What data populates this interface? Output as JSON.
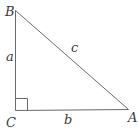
{
  "diagram": {
    "type": "right-triangle",
    "vertices": [
      {
        "id": "B",
        "label": "B",
        "x": 15,
        "y": 10,
        "label_x": 5,
        "label_y": 16
      },
      {
        "id": "C",
        "label": "C",
        "x": 15,
        "y": 110,
        "label_x": 6,
        "label_y": 127,
        "right_angle": true
      },
      {
        "id": "A",
        "label": "A",
        "x": 128,
        "y": 109,
        "label_x": 130,
        "label_y": 122
      }
    ],
    "sides": [
      {
        "id": "a",
        "label": "a",
        "from": "B",
        "to": "C",
        "label_x": 6,
        "label_y": 61
      },
      {
        "id": "b",
        "label": "b",
        "from": "C",
        "to": "A",
        "label_x": 64,
        "label_y": 124
      },
      {
        "id": "c",
        "label": "c",
        "from": "B",
        "to": "A",
        "label_x": 70,
        "label_y": 52
      }
    ],
    "right_angle_marker_size": 12,
    "colors": {
      "stroke": "#6a6a6a",
      "text": "#3a3a3a",
      "background": "#ffffff"
    }
  }
}
